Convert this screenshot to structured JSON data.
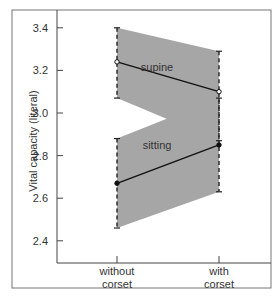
{
  "chart_data": {
    "type": "line",
    "title": "",
    "xlabel": "",
    "ylabel": "Vital capacity (literal)",
    "ylim": [
      2.33,
      3.48
    ],
    "yticks": [
      2.4,
      2.6,
      2.8,
      3.0,
      3.2,
      3.4
    ],
    "ytick_labels": [
      "2.4",
      "2.6",
      "2.8",
      "3.0",
      "3.2",
      "3.4"
    ],
    "categories": [
      "without corset",
      "with corset"
    ],
    "category_lines": [
      [
        "without",
        "corset"
      ],
      [
        "with",
        "corset"
      ]
    ],
    "grid": false,
    "legend": "none (inline labels)",
    "series": [
      {
        "name": "supine",
        "values": [
          3.24,
          3.1
        ],
        "upper": [
          3.4,
          3.29
        ],
        "lower": [
          3.07,
          2.87
        ],
        "marker": "open-circle",
        "label_pos": {
          "x": 157,
          "y": 71
        }
      },
      {
        "name": "sitting",
        "values": [
          2.67,
          2.85
        ],
        "upper": [
          2.88,
          3.07
        ],
        "lower": [
          2.46,
          2.63
        ],
        "marker": "filled-circle",
        "label_pos": {
          "x": 157,
          "y": 149
        }
      }
    ],
    "colors": {
      "band": "#a6a6a6",
      "line": "#111111",
      "axis": "#444444",
      "frame": "#666666"
    }
  }
}
